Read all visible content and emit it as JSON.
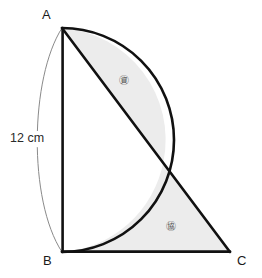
{
  "figure": {
    "type": "geometry-diagram",
    "colors": {
      "stroke": "#111111",
      "thin_stroke": "#808080",
      "fill": "#ececec",
      "background": "#ffffff",
      "text": "#1a1a1a"
    },
    "vertices": [
      {
        "name": "A",
        "label": "A",
        "x": 62,
        "y": 28
      },
      {
        "name": "B",
        "label": "B",
        "x": 62,
        "y": 252
      },
      {
        "name": "C",
        "label": "C",
        "x": 230,
        "y": 252
      }
    ],
    "semicircle": {
      "diameter_endpoints": [
        "A",
        "B"
      ],
      "center_x": 62,
      "center_y": 140,
      "radius": 112,
      "bulge_direction": "right"
    },
    "dimension": {
      "label": "12 cm",
      "measures": "AB",
      "value": 12,
      "unit": "cm"
    },
    "regions": [
      {
        "id": "upper",
        "label": "㊮",
        "description": "lens between arc AB and chord AC"
      },
      {
        "id": "lower",
        "label": "㊯",
        "description": "region bounded by AC, BC and arc"
      }
    ]
  }
}
